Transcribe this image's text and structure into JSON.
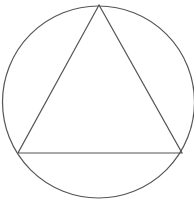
{
  "diagram": {
    "stroke_color": "#555555",
    "background": "#ffffff",
    "circle": {
      "cx": 98.5,
      "cy": 102,
      "r": 96
    },
    "triangle": {
      "vertices": [
        {
          "name": "apex",
          "x": 99,
          "y": 5
        },
        {
          "name": "bottom-left",
          "x": 18,
          "y": 153
        },
        {
          "name": "bottom-right",
          "x": 182,
          "y": 153
        }
      ]
    }
  }
}
